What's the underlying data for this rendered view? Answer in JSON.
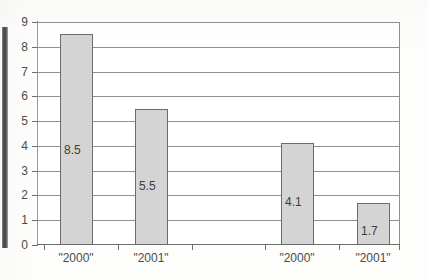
{
  "chart_data": {
    "type": "bar",
    "title": "",
    "subtitle": "",
    "xlabel": "",
    "ylabel": "",
    "categories": [
      "\"2000\"",
      "\"2001\"",
      "\"2000\"",
      "\"2001\""
    ],
    "values": [
      8.5,
      5.5,
      4.1,
      1.7
    ],
    "data_labels": [
      "8.5",
      "5.5",
      "4.1",
      "1.7"
    ],
    "series": [
      {
        "name": "",
        "values": [
          8.5,
          5.5,
          4.1,
          1.7
        ]
      }
    ],
    "ylim": [
      0,
      9
    ],
    "ytick_labels": [
      "0",
      "1",
      "2",
      "3",
      "4",
      "5",
      "6",
      "7",
      "8",
      "9"
    ],
    "ytick_values": [
      0,
      1,
      2,
      3,
      4,
      5,
      6,
      7,
      8,
      9
    ],
    "grid": "horizontal",
    "legend": "none",
    "bar_fill_color": "#d4d4d4",
    "bar_border_color": "#6b6b6b",
    "gridline_color": "#8f8f8f",
    "axis_color": "#6f6f6f",
    "text_color": "#4b4b4b",
    "background_color": "#ffffff"
  },
  "artifacts": {
    "scan_edge_label": "scan-edge-strip"
  }
}
